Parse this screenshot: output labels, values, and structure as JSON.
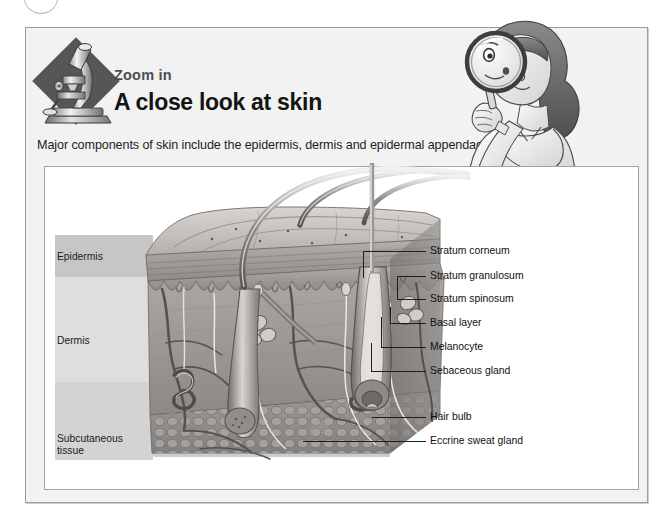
{
  "page": {
    "top_ornament": "partial-circle"
  },
  "header": {
    "badge_icon": "microscope-icon",
    "eyebrow": "Zoom in",
    "title": "A close look at skin",
    "subtitle": "Major components of skin include the epidermis, dermis and epidermal appendages.",
    "side_illustration": "girl-with-magnifying-glass-icon"
  },
  "figure": {
    "illustration": "skin-cross-section-illustration",
    "layers": [
      {
        "id": "epidermis",
        "label": "Epidermis",
        "color": "#c6c6c6"
      },
      {
        "id": "dermis",
        "label": "Dermis",
        "color": "#dedede"
      },
      {
        "id": "subcutaneous",
        "label": "Subcutaneous\ntissue",
        "label_line1": "Subcutaneous",
        "label_line2": "tissue",
        "color": "#d3d3d3"
      }
    ],
    "callouts": [
      {
        "id": "stratum-corneum",
        "label": "Stratum corneum"
      },
      {
        "id": "stratum-granulosum",
        "label": "Stratum granulosum"
      },
      {
        "id": "stratum-spinosum",
        "label": "Stratum spinosum"
      },
      {
        "id": "basal-layer",
        "label": "Basal layer"
      },
      {
        "id": "melanocyte",
        "label": "Melanocyte"
      },
      {
        "id": "sebaceous-gland",
        "label": "Sebaceous gland"
      },
      {
        "id": "hair-bulb",
        "label": "Hair bulb"
      },
      {
        "id": "eccrine-sweat-gland",
        "label": "Eccrine sweat gland"
      }
    ]
  },
  "colors": {
    "card_background": "#f2f2f2",
    "panel_background": "#ffffff",
    "border": "#9b9b9b",
    "badge_diamond": "#565656",
    "text": "#141414"
  }
}
